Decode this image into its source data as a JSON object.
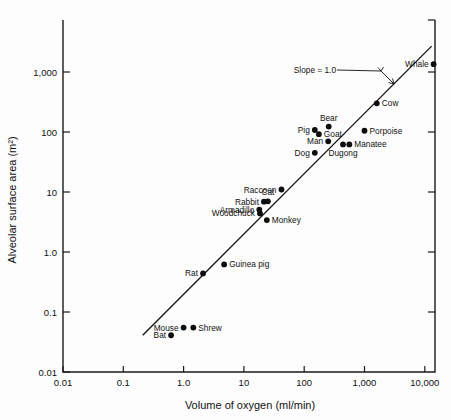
{
  "chart_data": {
    "type": "scatter",
    "title": "",
    "xlabel": "Volume of oxygen (ml/min)",
    "ylabel": "Alveolar surface area (m²)",
    "xscale": "log",
    "yscale": "log",
    "xlim": [
      0.01,
      10000
    ],
    "ylim": [
      0.01,
      3000
    ],
    "grid": false,
    "legend": false,
    "xticklabels": [
      "0.01",
      "0.1",
      "1.0",
      "10",
      "100",
      "1,000",
      "10,000"
    ],
    "xtickvalues": [
      0.01,
      0.1,
      1,
      10,
      100,
      1000,
      10000
    ],
    "yticklabels": [
      "0.01",
      "0.1",
      "1.0",
      "10",
      "100",
      "1,000"
    ],
    "ytickvalues": [
      0.01,
      0.1,
      1,
      10,
      100,
      1000
    ],
    "annotations": [
      {
        "text": "Slope = 1.0",
        "x": 300,
        "y": 1000
      }
    ],
    "trendline": {
      "label": "Slope = 1.0",
      "slope": 1.0,
      "x0": 0.21,
      "y0": 0.041,
      "x1": 13000,
      "y1": 2700
    },
    "points": [
      {
        "name": "Bat",
        "x": 0.62,
        "y": 0.041,
        "label_side": "left"
      },
      {
        "name": "Mouse",
        "x": 1.0,
        "y": 0.055,
        "label_side": "left"
      },
      {
        "name": "Shrew",
        "x": 1.45,
        "y": 0.055,
        "label_side": "right"
      },
      {
        "name": "Rat",
        "x": 2.1,
        "y": 0.44,
        "label_side": "left"
      },
      {
        "name": "Guinea pig",
        "x": 4.7,
        "y": 0.62,
        "label_side": "right"
      },
      {
        "name": "Woodchuck",
        "x": 18.5,
        "y": 4.4,
        "label_side": "left"
      },
      {
        "name": "Armadillo",
        "x": 18.0,
        "y": 5.1,
        "label_side": "left"
      },
      {
        "name": "Rabbit",
        "x": 21.5,
        "y": 6.9,
        "label_side": "left"
      },
      {
        "name": "Cat",
        "x": 25.0,
        "y": 7.0,
        "label_side": "above"
      },
      {
        "name": "Monkey",
        "x": 24.0,
        "y": 3.4,
        "label_side": "right"
      },
      {
        "name": "Raccoon",
        "x": 42.0,
        "y": 11.0,
        "label_side": "left"
      },
      {
        "name": "Dog",
        "x": 150.0,
        "y": 45.0,
        "label_side": "left"
      },
      {
        "name": "Pig",
        "x": 150.0,
        "y": 108.0,
        "label_side": "left"
      },
      {
        "name": "Goat",
        "x": 175.0,
        "y": 92.0,
        "label_side": "right"
      },
      {
        "name": "Man",
        "x": 250.0,
        "y": 70.0,
        "label_side": "left"
      },
      {
        "name": "Bear",
        "x": 255.0,
        "y": 123.0,
        "label_side": "above"
      },
      {
        "name": "Dugong",
        "x": 440.0,
        "y": 62.0,
        "label_side": "below"
      },
      {
        "name": "Manatee",
        "x": 560.0,
        "y": 62.0,
        "label_side": "right"
      },
      {
        "name": "Porpoise",
        "x": 1000.0,
        "y": 105.0,
        "label_side": "right"
      },
      {
        "name": "Cow",
        "x": 1600.0,
        "y": 300.0,
        "label_side": "right"
      },
      {
        "name": "Whale",
        "x": 14000.0,
        "y": 1350.0,
        "label_side": "left"
      }
    ]
  }
}
